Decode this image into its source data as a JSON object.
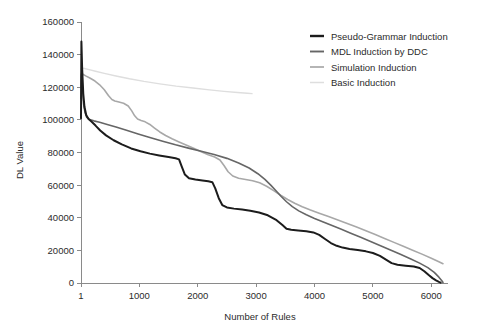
{
  "chart_data": {
    "type": "line",
    "title": "",
    "xlabel": "Number of Rules",
    "ylabel": "DL Value",
    "xlim": [
      1,
      6200
    ],
    "ylim": [
      0,
      160000
    ],
    "grid": false,
    "legend_position": "top-right",
    "x_ticks": [
      "1",
      "1000",
      "2000",
      "3000",
      "4000",
      "5000",
      "6000"
    ],
    "x_tick_values": [
      1,
      1000,
      2000,
      3000,
      4000,
      5000,
      6000
    ],
    "y_ticks": [
      "0",
      "20000",
      "40000",
      "60000",
      "80000",
      "100000",
      "120000",
      "140000",
      "160000"
    ],
    "y_tick_values": [
      0,
      20000,
      40000,
      60000,
      80000,
      100000,
      120000,
      140000,
      160000
    ],
    "series": [
      {
        "name": "Pseudo-Grammar Induction",
        "color": "#1c1c1c",
        "width": 2.0,
        "points": [
          [
            1,
            101000
          ],
          [
            8,
            148000
          ],
          [
            20,
            132000
          ],
          [
            40,
            116000
          ],
          [
            60,
            108000
          ],
          [
            90,
            103000
          ],
          [
            130,
            100500
          ],
          [
            180,
            99000
          ],
          [
            250,
            96500
          ],
          [
            330,
            93500
          ],
          [
            430,
            90500
          ],
          [
            560,
            87500
          ],
          [
            700,
            85000
          ],
          [
            860,
            82500
          ],
          [
            1020,
            80800
          ],
          [
            1180,
            79300
          ],
          [
            1340,
            78200
          ],
          [
            1500,
            77200
          ],
          [
            1620,
            76500
          ],
          [
            1680,
            75800
          ],
          [
            1720,
            72000
          ],
          [
            1780,
            66500
          ],
          [
            1850,
            64200
          ],
          [
            1960,
            63400
          ],
          [
            2080,
            62900
          ],
          [
            2180,
            62400
          ],
          [
            2250,
            61800
          ],
          [
            2300,
            58000
          ],
          [
            2360,
            52000
          ],
          [
            2420,
            47800
          ],
          [
            2500,
            46300
          ],
          [
            2620,
            45600
          ],
          [
            2760,
            45000
          ],
          [
            2900,
            44300
          ],
          [
            3050,
            43200
          ],
          [
            3200,
            41500
          ],
          [
            3350,
            38500
          ],
          [
            3450,
            35500
          ],
          [
            3520,
            33200
          ],
          [
            3600,
            32600
          ],
          [
            3720,
            32200
          ],
          [
            3860,
            31700
          ],
          [
            3980,
            31000
          ],
          [
            4080,
            29500
          ],
          [
            4180,
            27000
          ],
          [
            4280,
            24500
          ],
          [
            4380,
            22800
          ],
          [
            4480,
            21700
          ],
          [
            4600,
            20900
          ],
          [
            4740,
            20200
          ],
          [
            4880,
            19400
          ],
          [
            5000,
            18400
          ],
          [
            5120,
            16600
          ],
          [
            5230,
            14200
          ],
          [
            5320,
            12200
          ],
          [
            5420,
            11200
          ],
          [
            5560,
            10600
          ],
          [
            5700,
            10100
          ],
          [
            5800,
            9200
          ],
          [
            5880,
            7200
          ],
          [
            5950,
            5000
          ],
          [
            6020,
            3000
          ],
          [
            6080,
            1600
          ],
          [
            6130,
            700
          ],
          [
            6160,
            200
          ]
        ]
      },
      {
        "name": "MDL Induction by DDC",
        "color": "#666666",
        "width": 1.6,
        "points": [
          [
            1,
            113000
          ],
          [
            10,
            128000
          ],
          [
            25,
            120000
          ],
          [
            45,
            110000
          ],
          [
            70,
            104500
          ],
          [
            100,
            101500
          ],
          [
            150,
            100200
          ],
          [
            220,
            99400
          ],
          [
            320,
            98500
          ],
          [
            450,
            97200
          ],
          [
            600,
            95600
          ],
          [
            780,
            93600
          ],
          [
            980,
            91400
          ],
          [
            1180,
            89200
          ],
          [
            1400,
            86900
          ],
          [
            1620,
            84700
          ],
          [
            1840,
            82700
          ],
          [
            2060,
            80800
          ],
          [
            2280,
            78800
          ],
          [
            2500,
            76400
          ],
          [
            2700,
            73600
          ],
          [
            2880,
            70500
          ],
          [
            3030,
            67000
          ],
          [
            3150,
            63500
          ],
          [
            3250,
            60000
          ],
          [
            3340,
            56500
          ],
          [
            3430,
            53000
          ],
          [
            3520,
            49800
          ],
          [
            3620,
            46800
          ],
          [
            3730,
            44200
          ],
          [
            3860,
            41800
          ],
          [
            4000,
            39600
          ],
          [
            4150,
            37400
          ],
          [
            4300,
            35200
          ],
          [
            4460,
            32900
          ],
          [
            4620,
            30500
          ],
          [
            4790,
            28000
          ],
          [
            4960,
            25400
          ],
          [
            5130,
            22800
          ],
          [
            5300,
            20200
          ],
          [
            5470,
            17600
          ],
          [
            5640,
            14900
          ],
          [
            5800,
            12200
          ],
          [
            5940,
            9400
          ],
          [
            6050,
            6500
          ],
          [
            6130,
            3600
          ],
          [
            6180,
            1400
          ],
          [
            6200,
            300
          ]
        ]
      },
      {
        "name": "Simulation Induction",
        "color": "#a8a8a8",
        "width": 1.6,
        "points": [
          [
            1,
            120000
          ],
          [
            12,
            128500
          ],
          [
            40,
            127800
          ],
          [
            90,
            126800
          ],
          [
            160,
            125500
          ],
          [
            240,
            123800
          ],
          [
            320,
            121500
          ],
          [
            400,
            118500
          ],
          [
            470,
            115000
          ],
          [
            530,
            112500
          ],
          [
            580,
            111600
          ],
          [
            650,
            111000
          ],
          [
            730,
            110200
          ],
          [
            810,
            108500
          ],
          [
            870,
            105500
          ],
          [
            920,
            102500
          ],
          [
            970,
            100500
          ],
          [
            1030,
            99600
          ],
          [
            1100,
            98800
          ],
          [
            1180,
            97200
          ],
          [
            1260,
            95000
          ],
          [
            1350,
            92600
          ],
          [
            1450,
            90400
          ],
          [
            1560,
            88400
          ],
          [
            1680,
            86500
          ],
          [
            1800,
            84600
          ],
          [
            1930,
            82600
          ],
          [
            2060,
            80500
          ],
          [
            2180,
            78600
          ],
          [
            2290,
            77200
          ],
          [
            2380,
            75400
          ],
          [
            2450,
            72000
          ],
          [
            2520,
            68200
          ],
          [
            2600,
            65600
          ],
          [
            2700,
            64200
          ],
          [
            2820,
            63500
          ],
          [
            2940,
            62700
          ],
          [
            3060,
            61400
          ],
          [
            3180,
            59300
          ],
          [
            3300,
            56600
          ],
          [
            3420,
            53800
          ],
          [
            3540,
            51200
          ],
          [
            3660,
            48900
          ],
          [
            3790,
            46800
          ],
          [
            3930,
            44800
          ],
          [
            4080,
            42800
          ],
          [
            4240,
            40700
          ],
          [
            4400,
            38600
          ],
          [
            4560,
            36500
          ],
          [
            4720,
            34300
          ],
          [
            4880,
            32000
          ],
          [
            5040,
            29700
          ],
          [
            5200,
            27300
          ],
          [
            5360,
            24900
          ],
          [
            5520,
            22500
          ],
          [
            5680,
            20100
          ],
          [
            5840,
            17700
          ],
          [
            6000,
            15200
          ],
          [
            6120,
            13200
          ],
          [
            6200,
            11800
          ]
        ]
      },
      {
        "name": "Basic Induction",
        "color": "#dedede",
        "width": 1.4,
        "points": [
          [
            1,
            126000
          ],
          [
            15,
            131800
          ],
          [
            60,
            131500
          ],
          [
            140,
            130800
          ],
          [
            250,
            129800
          ],
          [
            400,
            128500
          ],
          [
            600,
            126900
          ],
          [
            830,
            125200
          ],
          [
            1080,
            123600
          ],
          [
            1350,
            122100
          ],
          [
            1630,
            120700
          ],
          [
            1920,
            119500
          ],
          [
            2200,
            118400
          ],
          [
            2450,
            117500
          ],
          [
            2680,
            116800
          ],
          [
            2850,
            116300
          ],
          [
            2930,
            116100
          ]
        ]
      }
    ]
  },
  "legend": {
    "entries": [
      {
        "label": "Pseudo-Grammar Induction",
        "color": "#1c1c1c"
      },
      {
        "label": "MDL Induction by DDC",
        "color": "#666666"
      },
      {
        "label": "Simulation Induction",
        "color": "#a8a8a8"
      },
      {
        "label": "Basic Induction",
        "color": "#dedede"
      }
    ]
  }
}
